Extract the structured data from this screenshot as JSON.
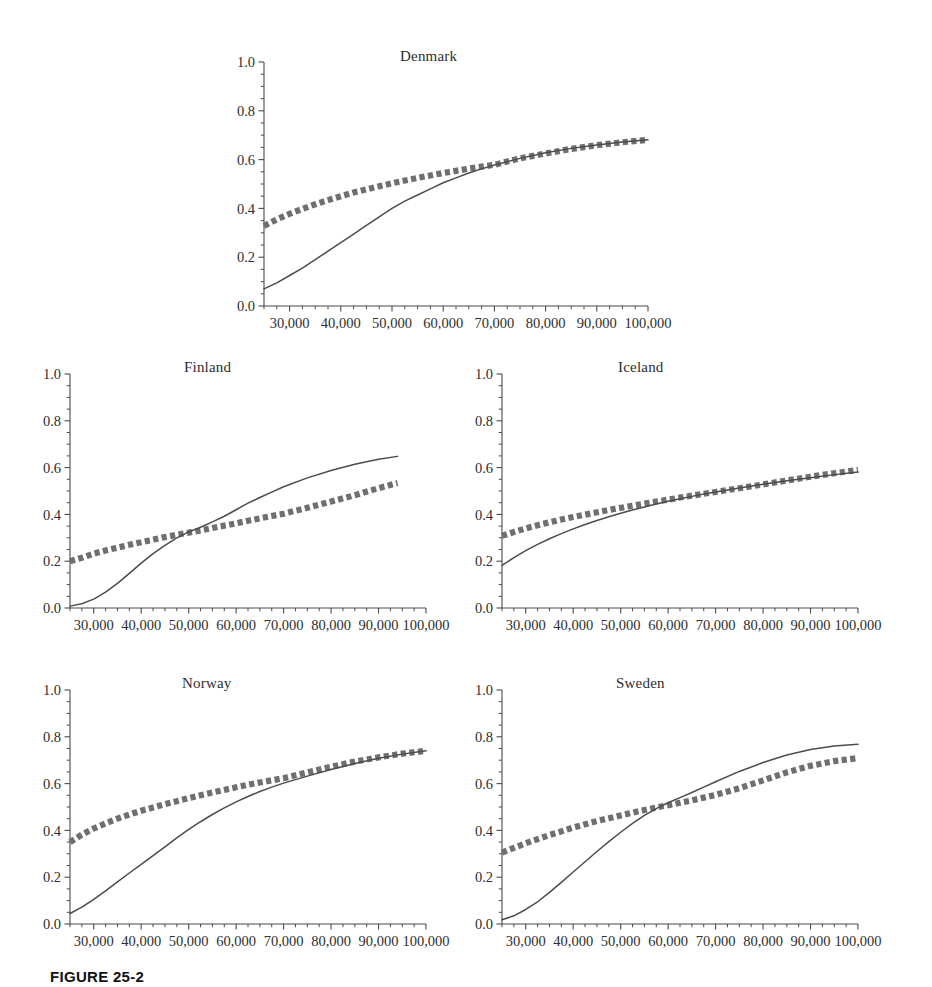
{
  "figure": {
    "caption": "FIGURE 25-2",
    "axis": {
      "y_ticks": [
        "0.0",
        "0.2",
        "0.4",
        "0.6",
        "0.8",
        "1.0"
      ],
      "y_values": [
        0.0,
        0.2,
        0.4,
        0.6,
        0.8,
        1.0
      ],
      "y_minor_step": 0.05,
      "x_ticks": [
        "30,000",
        "40,000",
        "50,000",
        "60,000",
        "70,000",
        "80,000",
        "90,000",
        "100,000"
      ],
      "x_values": [
        30000,
        40000,
        50000,
        60000,
        70000,
        80000,
        90000,
        100000
      ],
      "x_minor_step": 2500,
      "xlim": [
        25000,
        100000
      ],
      "ylim": [
        0.0,
        1.0
      ]
    },
    "colors": {
      "solid_line": "#4c4c4c",
      "dotted_line": "#6f6f6f",
      "axis": "#4a4a4a",
      "text": "#2e2e2e",
      "background": "#ffffff"
    }
  },
  "chart_data": {
    "type": "line",
    "title": "",
    "xlabel": "",
    "ylabel": "",
    "xlim": [
      25000,
      100000
    ],
    "ylim": [
      0.0,
      1.0
    ],
    "grid": false,
    "legend": "none",
    "x_tick_labels": [
      "30,000",
      "40,000",
      "50,000",
      "60,000",
      "70,000",
      "80,000",
      "90,000",
      "100,000"
    ],
    "y_tick_labels": [
      "0.0",
      "0.2",
      "0.4",
      "0.6",
      "0.8",
      "1.0"
    ],
    "panels": [
      {
        "title": "Denmark",
        "series": [
          {
            "name": "solid",
            "style": "solid",
            "x": [
              25000,
              27500,
              30000,
              32500,
              35000,
              37500,
              40000,
              42500,
              45000,
              47500,
              50000,
              52500,
              55000,
              57500,
              60000,
              62500,
              65000,
              67500,
              70000,
              75000,
              80000,
              85000,
              90000,
              95000,
              100000
            ],
            "y": [
              0.07,
              0.095,
              0.125,
              0.155,
              0.19,
              0.225,
              0.26,
              0.295,
              0.33,
              0.365,
              0.4,
              0.43,
              0.455,
              0.48,
              0.505,
              0.525,
              0.545,
              0.562,
              0.578,
              0.605,
              0.628,
              0.646,
              0.66,
              0.672,
              0.681
            ]
          },
          {
            "name": "dotted",
            "style": "dotted",
            "x": [
              25000,
              27500,
              30000,
              32500,
              35000,
              37500,
              40000,
              42500,
              45000,
              47500,
              50000,
              52500,
              55000,
              57500,
              60000,
              62500,
              65000,
              67500,
              70000,
              75000,
              80000,
              85000,
              90000,
              95000,
              100000
            ],
            "y": [
              0.328,
              0.355,
              0.378,
              0.398,
              0.417,
              0.434,
              0.45,
              0.465,
              0.478,
              0.491,
              0.503,
              0.514,
              0.525,
              0.535,
              0.545,
              0.554,
              0.563,
              0.571,
              0.579,
              0.605,
              0.625,
              0.644,
              0.659,
              0.671,
              0.681
            ]
          }
        ]
      },
      {
        "title": "Finland",
        "series": [
          {
            "name": "solid",
            "style": "solid",
            "x": [
              25000,
              27500,
              30000,
              32500,
              35000,
              37500,
              40000,
              42500,
              45000,
              47500,
              50000,
              52500,
              55000,
              57500,
              60000,
              62500,
              65000,
              67500,
              70000,
              75000,
              80000,
              85000,
              90000,
              94000
            ],
            "y": [
              0.008,
              0.018,
              0.038,
              0.068,
              0.105,
              0.148,
              0.192,
              0.232,
              0.268,
              0.3,
              0.325,
              0.345,
              0.368,
              0.392,
              0.42,
              0.448,
              0.472,
              0.495,
              0.518,
              0.556,
              0.588,
              0.614,
              0.636,
              0.648
            ]
          },
          {
            "name": "dotted",
            "style": "dotted",
            "x": [
              25000,
              27500,
              30000,
              32500,
              35000,
              37500,
              40000,
              42500,
              45000,
              47500,
              50000,
              52500,
              55000,
              57500,
              60000,
              62500,
              65000,
              67500,
              70000,
              75000,
              80000,
              85000,
              90000,
              94000
            ],
            "y": [
              0.2,
              0.215,
              0.232,
              0.246,
              0.258,
              0.27,
              0.281,
              0.292,
              0.303,
              0.313,
              0.322,
              0.331,
              0.342,
              0.352,
              0.362,
              0.373,
              0.383,
              0.393,
              0.403,
              0.428,
              0.455,
              0.482,
              0.512,
              0.534
            ]
          }
        ]
      },
      {
        "title": "Iceland",
        "series": [
          {
            "name": "solid",
            "style": "solid",
            "x": [
              25000,
              27500,
              30000,
              32500,
              35000,
              37500,
              40000,
              42500,
              45000,
              47500,
              50000,
              52500,
              55000,
              57500,
              60000,
              62500,
              65000,
              67500,
              70000,
              75000,
              80000,
              85000,
              90000,
              95000,
              100000
            ],
            "y": [
              0.182,
              0.215,
              0.245,
              0.272,
              0.296,
              0.318,
              0.338,
              0.357,
              0.374,
              0.39,
              0.405,
              0.419,
              0.432,
              0.444,
              0.456,
              0.467,
              0.477,
              0.487,
              0.496,
              0.513,
              0.529,
              0.544,
              0.557,
              0.57,
              0.581
            ]
          },
          {
            "name": "dotted",
            "style": "dotted",
            "x": [
              25000,
              27500,
              30000,
              32500,
              35000,
              37500,
              40000,
              42500,
              45000,
              47500,
              50000,
              52500,
              55000,
              57500,
              60000,
              62500,
              65000,
              67500,
              70000,
              75000,
              80000,
              85000,
              90000,
              95000,
              100000
            ],
            "y": [
              0.308,
              0.325,
              0.34,
              0.354,
              0.366,
              0.378,
              0.389,
              0.399,
              0.409,
              0.419,
              0.428,
              0.437,
              0.446,
              0.455,
              0.463,
              0.472,
              0.48,
              0.488,
              0.496,
              0.512,
              0.528,
              0.545,
              0.561,
              0.576,
              0.59
            ]
          }
        ]
      },
      {
        "title": "Norway",
        "series": [
          {
            "name": "solid",
            "style": "solid",
            "x": [
              25000,
              27500,
              30000,
              32500,
              35000,
              37500,
              40000,
              42500,
              45000,
              47500,
              50000,
              52500,
              55000,
              57500,
              60000,
              62500,
              65000,
              67500,
              70000,
              75000,
              80000,
              85000,
              90000,
              95000,
              100000
            ],
            "y": [
              0.045,
              0.072,
              0.105,
              0.142,
              0.18,
              0.218,
              0.255,
              0.292,
              0.33,
              0.368,
              0.404,
              0.437,
              0.468,
              0.496,
              0.522,
              0.545,
              0.566,
              0.585,
              0.602,
              0.632,
              0.66,
              0.686,
              0.708,
              0.726,
              0.74
            ]
          },
          {
            "name": "dotted",
            "style": "dotted",
            "x": [
              25000,
              27500,
              30000,
              32500,
              35000,
              37500,
              40000,
              42500,
              45000,
              47500,
              50000,
              52500,
              55000,
              57500,
              60000,
              62500,
              65000,
              67500,
              70000,
              75000,
              80000,
              85000,
              90000,
              95000,
              100000
            ],
            "y": [
              0.35,
              0.382,
              0.408,
              0.43,
              0.45,
              0.468,
              0.484,
              0.498,
              0.512,
              0.525,
              0.538,
              0.55,
              0.562,
              0.573,
              0.584,
              0.595,
              0.605,
              0.614,
              0.623,
              0.648,
              0.672,
              0.694,
              0.712,
              0.728,
              0.74
            ]
          }
        ]
      },
      {
        "title": "Sweden",
        "series": [
          {
            "name": "solid",
            "style": "solid",
            "x": [
              25000,
              27500,
              30000,
              32500,
              35000,
              37500,
              40000,
              42500,
              45000,
              47500,
              50000,
              52500,
              55000,
              57500,
              60000,
              62500,
              65000,
              67500,
              70000,
              75000,
              80000,
              85000,
              90000,
              95000,
              100000
            ],
            "y": [
              0.018,
              0.035,
              0.062,
              0.095,
              0.135,
              0.178,
              0.222,
              0.266,
              0.31,
              0.352,
              0.392,
              0.43,
              0.464,
              0.493,
              0.518,
              0.54,
              0.562,
              0.585,
              0.608,
              0.652,
              0.69,
              0.722,
              0.746,
              0.761,
              0.768
            ]
          },
          {
            "name": "dotted",
            "style": "dotted",
            "x": [
              25000,
              27500,
              30000,
              32500,
              35000,
              37500,
              40000,
              42500,
              45000,
              47500,
              50000,
              52500,
              55000,
              57500,
              60000,
              62500,
              65000,
              67500,
              70000,
              75000,
              80000,
              85000,
              90000,
              95000,
              100000
            ],
            "y": [
              0.305,
              0.325,
              0.345,
              0.363,
              0.38,
              0.396,
              0.412,
              0.426,
              0.44,
              0.452,
              0.464,
              0.476,
              0.487,
              0.498,
              0.508,
              0.518,
              0.528,
              0.54,
              0.552,
              0.58,
              0.614,
              0.648,
              0.676,
              0.696,
              0.709
            ]
          }
        ]
      }
    ]
  }
}
